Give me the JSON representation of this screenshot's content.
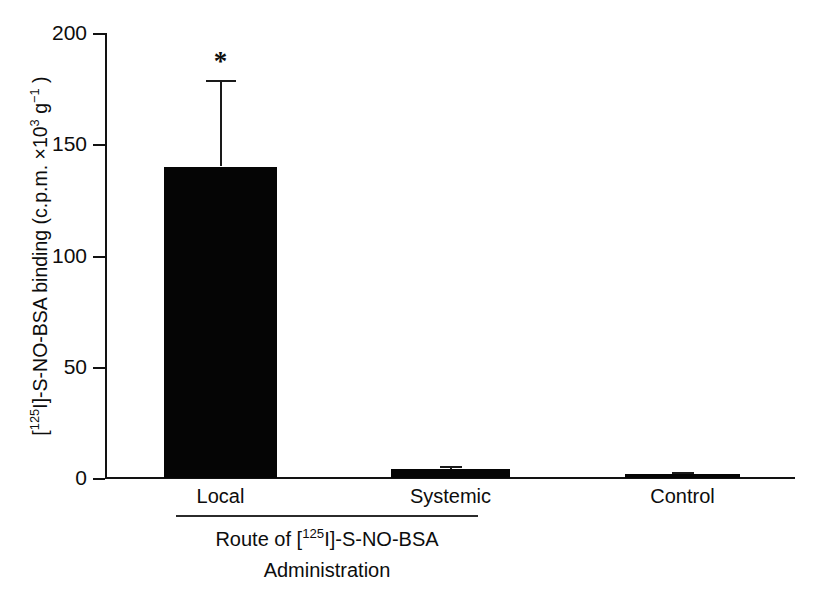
{
  "chart_data": {
    "type": "bar",
    "title": "",
    "categories": [
      "Local",
      "Systemic",
      "Control"
    ],
    "values": [
      140,
      4,
      2
    ],
    "errors": [
      39,
      1.5,
      0.8
    ],
    "series": [
      {
        "name": "[125I]-S-NO-BSA binding",
        "values": [
          140,
          4,
          2
        ],
        "errors": [
          39,
          1.5,
          0.8
        ]
      }
    ],
    "ylabel_parts": {
      "prefix": "[",
      "isotope_sup": "125",
      "isotope": "I]-S-NO-BSA binding (c.p.m. ×10",
      "exp3": "3",
      "gap": " g",
      "exp_minus1": "−1",
      "suffix": " )"
    },
    "ylabel_plain": "[125I]-S-NO-BSA binding (c.p.m. ×10^3 g^-1 )",
    "xlabel_line1_parts": {
      "prefix": "Route of [",
      "isotope_sup": "125",
      "suffix": "I]-S-NO-BSA"
    },
    "xlabel_line1_plain": "Route of [125I]-S-NO-BSA",
    "xlabel_line2": "Administration",
    "ylim": [
      0,
      200
    ],
    "yticks": [
      0,
      50,
      100,
      150,
      200
    ],
    "ytick_labels": [
      "0",
      "50",
      "100",
      "150",
      "200"
    ],
    "grid": false,
    "legend": "none",
    "annotations": [
      {
        "text": "*",
        "category": "Local",
        "meaning": "significance-marker"
      }
    ],
    "bar_color": "#050505",
    "axis_color": "#121212"
  }
}
